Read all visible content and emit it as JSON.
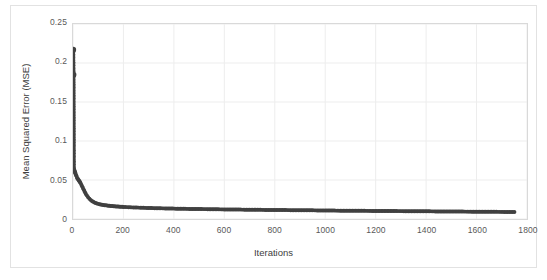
{
  "chart_data": {
    "type": "scatter",
    "title": "",
    "xlabel": "Iterations",
    "ylabel": "Mean Squared Error (MSE)",
    "xlim": [
      0,
      1800
    ],
    "ylim": [
      0,
      0.25
    ],
    "xticks": [
      0,
      200,
      400,
      600,
      800,
      1000,
      1200,
      1400,
      1600,
      1800
    ],
    "xtick_labels": [
      "0",
      "200",
      "400",
      "600",
      "800",
      "1000",
      "1200",
      "1400",
      "1600",
      "1800"
    ],
    "yticks": [
      0,
      0.05,
      0.1,
      0.15,
      0.2,
      0.25
    ],
    "ytick_labels": [
      "0",
      "0.05",
      "0.1",
      "0.15",
      "0.2",
      "0.25"
    ],
    "grid": "both",
    "legend": "none",
    "marker": "circle",
    "marker_color": "#404040",
    "line_color": "#404040",
    "series": [
      {
        "name": "MSE",
        "x": [
          1,
          2,
          3,
          4,
          5,
          6,
          7,
          8,
          9,
          10,
          12,
          14,
          16,
          18,
          20,
          22,
          24,
          26,
          28,
          30,
          33,
          36,
          39,
          42,
          45,
          48,
          51,
          55,
          60,
          65,
          70,
          75,
          80,
          85,
          90,
          95,
          100,
          110,
          120,
          130,
          140,
          150,
          160,
          170,
          180,
          190,
          200,
          220,
          240,
          260,
          280,
          300,
          330,
          360,
          390,
          420,
          450,
          480,
          510,
          540,
          570,
          600,
          650,
          700,
          750,
          800,
          850,
          900,
          950,
          1000,
          1060,
          1120,
          1180,
          1240,
          1300,
          1360,
          1420,
          1480,
          1540,
          1600,
          1660,
          1710,
          1750
        ],
        "y": [
          0.217,
          0.185,
          0.066,
          0.064,
          0.063,
          0.062,
          0.061,
          0.06,
          0.059,
          0.058,
          0.056,
          0.055,
          0.053,
          0.052,
          0.051,
          0.05,
          0.049,
          0.048,
          0.047,
          0.046,
          0.044,
          0.042,
          0.04,
          0.038,
          0.036,
          0.034,
          0.032,
          0.03,
          0.028,
          0.026,
          0.0245,
          0.023,
          0.022,
          0.0212,
          0.0205,
          0.0199,
          0.0194,
          0.0186,
          0.018,
          0.0175,
          0.0171,
          0.0167,
          0.0164,
          0.0161,
          0.0159,
          0.0157,
          0.0155,
          0.0151,
          0.0148,
          0.0146,
          0.0143,
          0.0141,
          0.0138,
          0.0136,
          0.0134,
          0.0132,
          0.013,
          0.0128,
          0.0127,
          0.0126,
          0.0124,
          0.0123,
          0.0121,
          0.0119,
          0.0117,
          0.0115,
          0.0114,
          0.0112,
          0.0111,
          0.0109,
          0.0107,
          0.0105,
          0.0104,
          0.0102,
          0.0101,
          0.0099,
          0.0098,
          0.0096,
          0.0095,
          0.0094,
          0.0092,
          0.0091,
          0.009
        ],
        "notes": "Monotonically decreasing convergence curve; steep drop from 0.217 to ~0.06 within first few iterations, elbow near iteration 60-100, long flat tail approaching 0.009 at iteration 1750."
      }
    ]
  },
  "style": {
    "plot_border_color": "#d9d9d9",
    "outer_border_color": "#e2e2e2",
    "gridline_color": "#ededed",
    "tick_label_color": "#595959",
    "axis_title_color": "#404040",
    "background": "#ffffff"
  }
}
